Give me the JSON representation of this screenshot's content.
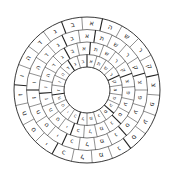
{
  "diagram": {
    "type": "letter-wheel",
    "center": [
      87,
      90
    ],
    "outer_radius": 73,
    "inner_radius": 23,
    "ring_count": 4,
    "sector_count": 22,
    "stroke_color": "#222222",
    "background": "#ffffff",
    "rings": [
      {
        "letters": [
          "ה",
          "ש",
          "ר",
          "ק",
          "צ",
          "פ",
          "ע",
          "ס",
          "נ",
          "מ",
          "ל",
          "כ",
          "י",
          "ט",
          "ח",
          "ז",
          "ו",
          "ה",
          "ד",
          "ג",
          "ב",
          "א"
        ]
      },
      {
        "letters": [
          "ת",
          "ש",
          "ר",
          "ק",
          "צ",
          "פ",
          "ע",
          "ס",
          "נ",
          "מ",
          "ל",
          "כ",
          "י",
          "ט",
          "ח",
          "ז",
          "ו",
          "ה",
          "ד",
          "ג",
          "ב",
          "א"
        ]
      },
      {
        "letters": [
          "ת",
          "ש",
          "ר",
          "ק",
          "צ",
          "פ",
          "ע",
          "ס",
          "נ",
          "מ",
          "ל",
          "כ",
          "י",
          "ט",
          "ח",
          "ז",
          "ו",
          "ה",
          "ד",
          "ג",
          "ב",
          "א"
        ]
      },
      {
        "letters": [
          "א",
          "ת",
          "ש",
          "ר",
          "ק",
          "צ",
          "פ",
          "ע",
          "ס",
          "נ",
          "מ",
          "ל",
          "כ",
          "י",
          "ט",
          "ח",
          "ז",
          "ו",
          "ה",
          "ד",
          "ג",
          "ב"
        ]
      }
    ]
  }
}
